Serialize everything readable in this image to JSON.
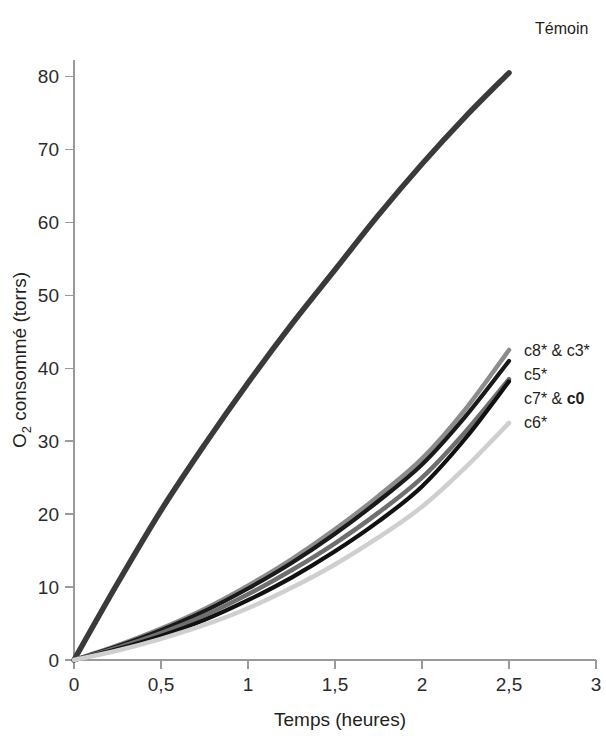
{
  "chart_data": {
    "type": "line",
    "title": "",
    "xlabel": "Temps (heures)",
    "ylabel": "O2 consommé (torrs)",
    "ylabel_parts": {
      "lead": "O",
      "sub": "2",
      "rest": " consommé (torrs)"
    },
    "xlim": [
      0,
      3
    ],
    "ylim": [
      0,
      85
    ],
    "grid": false,
    "legend_position": "right-inline-at-curve-end",
    "x_ticks": [
      0,
      0.5,
      1,
      1.5,
      2,
      2.5,
      3
    ],
    "x_tick_labels": [
      "0",
      "0,5",
      "1",
      "1,5",
      "2",
      "2,5",
      "3"
    ],
    "y_ticks": [
      0,
      10,
      20,
      30,
      40,
      50,
      60,
      70,
      80
    ],
    "y_tick_labels": [
      "0",
      "10",
      "20",
      "30",
      "40",
      "50",
      "60",
      "70",
      "80"
    ],
    "x": [
      0,
      0.25,
      0.5,
      0.75,
      1,
      1.25,
      1.5,
      1.75,
      2,
      2.25,
      2.5
    ],
    "series": [
      {
        "name": "Témoin",
        "label": "Témoin",
        "label_bold": false,
        "color": "#3a3a3a",
        "width": 5.5,
        "values": [
          0,
          10.5,
          20.5,
          29.5,
          38.0,
          46.0,
          53.5,
          61.0,
          68.0,
          74.5,
          80.5
        ]
      },
      {
        "name": "c8* & c3*",
        "label": "c8* & c3*",
        "label_bold": false,
        "color": "#8c8c8c",
        "width": 4.5,
        "values": [
          0,
          2.0,
          4.3,
          7.0,
          10.2,
          13.8,
          17.9,
          22.5,
          27.6,
          34.4,
          42.5
        ]
      },
      {
        "name": "c5*",
        "label": "c5*",
        "label_bold": false,
        "color": "#1a1a1a",
        "width": 4.2,
        "values": [
          0,
          1.9,
          4.1,
          6.7,
          9.8,
          13.3,
          17.3,
          21.8,
          26.8,
          33.4,
          41.0
        ]
      },
      {
        "name": "c7* & c0",
        "label": "c7* & c0",
        "label_bold": false,
        "label_bold_tail": "c0",
        "color": "#6f6f6f",
        "width": 4.5,
        "values": [
          0,
          1.7,
          3.7,
          6.1,
          9.0,
          12.3,
          16.0,
          20.2,
          25.0,
          31.3,
          38.5
        ]
      },
      {
        "name": "c7* & c0 dark",
        "label": "",
        "label_bold": false,
        "color": "#111111",
        "width": 4.2,
        "values": [
          0,
          1.5,
          3.3,
          5.5,
          8.2,
          11.3,
          14.9,
          19.0,
          23.8,
          30.4,
          38.2
        ]
      },
      {
        "name": "c6*",
        "label": "c6*",
        "label_bold": false,
        "color": "#cfcfcf",
        "width": 4.5,
        "values": [
          0,
          1.3,
          2.9,
          4.8,
          7.1,
          9.9,
          13.1,
          16.8,
          21.0,
          26.4,
          32.5
        ]
      }
    ]
  }
}
